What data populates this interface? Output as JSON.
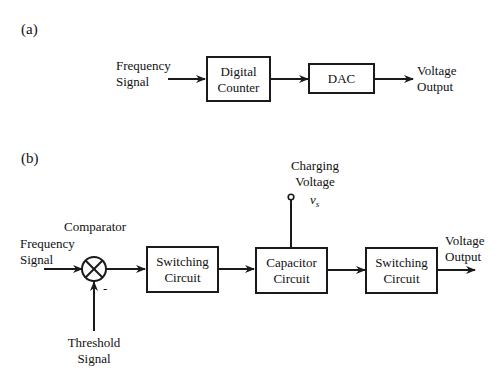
{
  "panel_a": {
    "label": "(a)",
    "input": {
      "line1": "Frequency",
      "line2": "Signal"
    },
    "blocks": [
      {
        "id": "digital-counter",
        "line1": "Digital",
        "line2": "Counter"
      },
      {
        "id": "dac",
        "line1": "DAC"
      }
    ],
    "output": {
      "line1": "Voltage",
      "line2": "Output"
    }
  },
  "panel_b": {
    "label": "(b)",
    "comparator_label": "Comparator",
    "comparator_minus": "-",
    "input": {
      "line1": "Frequency",
      "line2": "Signal"
    },
    "threshold": {
      "line1": "Threshold",
      "line2": "Signal"
    },
    "charging": {
      "line1": "Charging",
      "line2": "Voltage",
      "symbol": "v",
      "subscript": "s"
    },
    "blocks": [
      {
        "id": "switching-circuit-1",
        "line1": "Switching",
        "line2": "Circuit"
      },
      {
        "id": "capacitor-circuit",
        "line1": "Capacitor",
        "line2": "Circuit"
      },
      {
        "id": "switching-circuit-2",
        "line1": "Switching",
        "line2": "Circuit"
      }
    ],
    "output": {
      "line1": "Voltage",
      "line2": "Output"
    }
  },
  "colors": {
    "stroke": "#1a1a1a",
    "background": "#ffffff"
  }
}
